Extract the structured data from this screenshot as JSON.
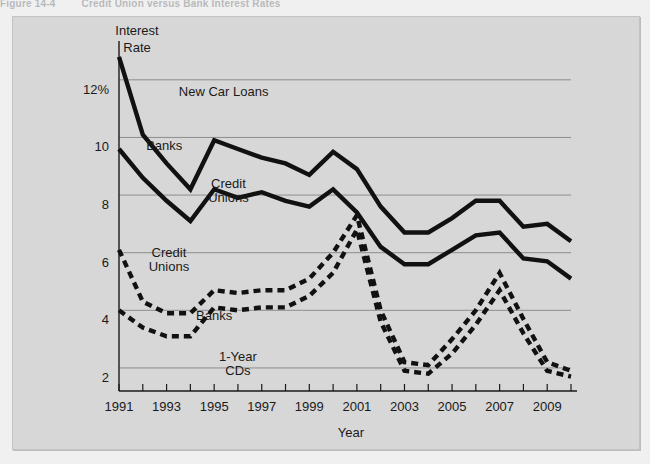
{
  "figure": {
    "number": "Figure 14-4",
    "title": "Credit Union versus Bank Interest Rates"
  },
  "chart_data": {
    "type": "line",
    "title": "Credit Union versus Bank Interest Rates",
    "xlabel": "Year",
    "ylabel": "Interest Rate",
    "ylabel_lines": [
      "Interest",
      "Rate"
    ],
    "xlim": [
      1991,
      2010
    ],
    "ylim": [
      1.2,
      13.0
    ],
    "grid": true,
    "legend_position": "inline-annotations",
    "ytick_labels": [
      "12%",
      "10",
      "8",
      "6",
      "4",
      "2"
    ],
    "ytick_values": [
      12,
      10,
      8,
      6,
      4,
      2
    ],
    "xtick_values": [
      1991,
      1992,
      1993,
      1994,
      1995,
      1996,
      1997,
      1998,
      1999,
      2000,
      2001,
      2002,
      2003,
      2004,
      2005,
      2006,
      2007,
      2008,
      2009,
      2010
    ],
    "xtick_labels": [
      "1991",
      "",
      "1993",
      "",
      "1995",
      "",
      "1997",
      "",
      "1999",
      "",
      "2001",
      "",
      "2003",
      "",
      "2005",
      "",
      "2007",
      "",
      "2009",
      ""
    ],
    "annotations": [
      {
        "text": "New Car Loans",
        "x": 1995.4,
        "y": 11.45
      },
      {
        "text": "Banks",
        "x": 1992.9,
        "y": 9.55
      },
      {
        "text": "Credit",
        "x": 1995.6,
        "y": 8.25
      },
      {
        "text": "Unions",
        "x": 1995.6,
        "y": 7.75
      },
      {
        "text": "Credit",
        "x": 1993.1,
        "y": 5.85
      },
      {
        "text": "Unions",
        "x": 1993.1,
        "y": 5.35
      },
      {
        "text": "Banks",
        "x": 1995.0,
        "y": 3.65
      },
      {
        "text": "1-Year",
        "x": 1996.0,
        "y": 2.25
      },
      {
        "text": "CDs",
        "x": 1996.0,
        "y": 1.75
      }
    ],
    "x": [
      1991,
      1992,
      1993,
      1994,
      1995,
      1996,
      1997,
      1998,
      1999,
      2000,
      2001,
      2002,
      2003,
      2004,
      2005,
      2006,
      2007,
      2008,
      2009,
      2010
    ],
    "series": [
      {
        "name": "New Car Loans - Banks",
        "style": "solid",
        "values": [
          12.8,
          10.1,
          9.1,
          8.2,
          9.9,
          9.6,
          9.3,
          9.1,
          8.7,
          9.5,
          8.9,
          7.6,
          6.7,
          6.7,
          7.2,
          7.8,
          7.8,
          6.9,
          7.0,
          6.4
        ]
      },
      {
        "name": "New Car Loans - Credit Unions",
        "style": "solid",
        "values": [
          9.6,
          8.6,
          7.8,
          7.1,
          8.2,
          7.9,
          8.1,
          7.8,
          7.6,
          8.2,
          7.4,
          6.2,
          5.6,
          5.6,
          6.1,
          6.6,
          6.7,
          5.8,
          5.7,
          5.1
        ]
      },
      {
        "name": "1-Year CDs - Credit Unions",
        "style": "dashed",
        "values": [
          6.1,
          4.3,
          3.9,
          3.9,
          4.7,
          4.6,
          4.7,
          4.7,
          5.1,
          6.0,
          7.3,
          4.0,
          2.2,
          2.1,
          3.0,
          4.0,
          5.3,
          3.7,
          2.2,
          1.9
        ]
      },
      {
        "name": "1-Year CDs - Banks",
        "style": "dashed",
        "values": [
          4.0,
          3.4,
          3.1,
          3.1,
          4.1,
          4.0,
          4.1,
          4.1,
          4.5,
          5.3,
          6.8,
          3.6,
          1.9,
          1.8,
          2.5,
          3.5,
          4.7,
          3.2,
          1.9,
          1.7
        ]
      }
    ]
  }
}
